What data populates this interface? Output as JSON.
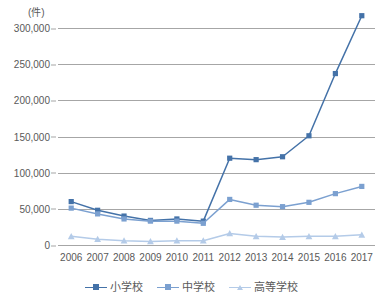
{
  "chart_data": {
    "type": "line",
    "title": "",
    "subtitle": "",
    "unit_label": "(件)",
    "xlabel": "",
    "ylabel": "",
    "categories": [
      "2006",
      "2007",
      "2008",
      "2009",
      "2010",
      "2011",
      "2012",
      "2013",
      "2014",
      "2015",
      "2016",
      "2017"
    ],
    "ylim": [
      0,
      300000
    ],
    "ytick_labels": [
      "300,000",
      "250,000",
      "200,000",
      "150,000",
      "100,000",
      "50,000",
      "0"
    ],
    "ytick_values": [
      300000,
      250000,
      200000,
      150000,
      100000,
      50000,
      0
    ],
    "ytick_interval": 50000,
    "grid": "horizontal",
    "legend_position": "bottom",
    "series": [
      {
        "name": "小学校",
        "color": "#4472a8",
        "marker": "square",
        "values": [
          60000,
          48000,
          40000,
          34000,
          36000,
          33000,
          120000,
          118000,
          122000,
          151000,
          237000,
          317000
        ]
      },
      {
        "name": "中学校",
        "color": "#7ba0d0",
        "marker": "square",
        "values": [
          51000,
          43000,
          36000,
          33000,
          33000,
          30000,
          63000,
          55000,
          53000,
          59000,
          71000,
          81000
        ]
      },
      {
        "name": "高等学校",
        "color": "#b4cbe8",
        "marker": "triangle",
        "values": [
          12000,
          8000,
          6000,
          5000,
          6000,
          6000,
          16000,
          12000,
          11000,
          12000,
          12000,
          14000
        ]
      }
    ]
  },
  "legend": {
    "items": [
      {
        "label": "小学校"
      },
      {
        "label": "中学校"
      },
      {
        "label": "高等学校"
      }
    ]
  },
  "axes": {
    "unit": "(件)"
  }
}
